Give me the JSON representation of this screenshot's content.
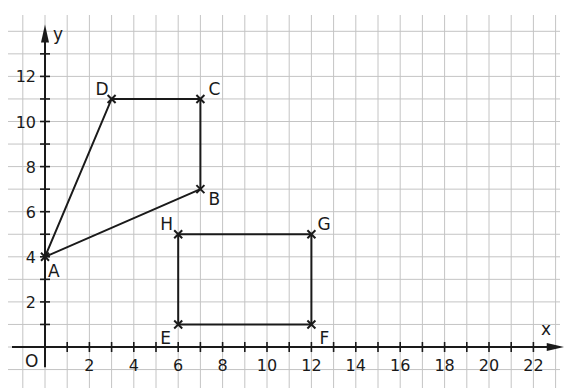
{
  "diagram": {
    "type": "coordinate-grid",
    "axes": {
      "x_label": "x",
      "y_label": "y",
      "origin_label": "O",
      "x_ticks": [
        "2",
        "4",
        "6",
        "8",
        "10",
        "12",
        "14",
        "16",
        "18",
        "20",
        "22"
      ],
      "y_ticks": [
        "2",
        "4",
        "6",
        "8",
        "10",
        "12"
      ]
    },
    "points": [
      {
        "name": "A",
        "x": 0,
        "y": 4
      },
      {
        "name": "B",
        "x": 7,
        "y": 7
      },
      {
        "name": "C",
        "x": 7,
        "y": 11
      },
      {
        "name": "D",
        "x": 3,
        "y": 11
      },
      {
        "name": "E",
        "x": 6,
        "y": 1
      },
      {
        "name": "F",
        "x": 12,
        "y": 1
      },
      {
        "name": "G",
        "x": 12,
        "y": 5
      },
      {
        "name": "H",
        "x": 6,
        "y": 5
      }
    ],
    "shapes": [
      {
        "name": "quadrilateral ABCD",
        "vertices": [
          "A",
          "B",
          "C",
          "D"
        ]
      },
      {
        "name": "rectangle EFGH",
        "vertices": [
          "E",
          "F",
          "G",
          "H"
        ]
      }
    ],
    "colors": {
      "ink": "#1a1a1a",
      "grid": "#c4c4c4"
    }
  }
}
